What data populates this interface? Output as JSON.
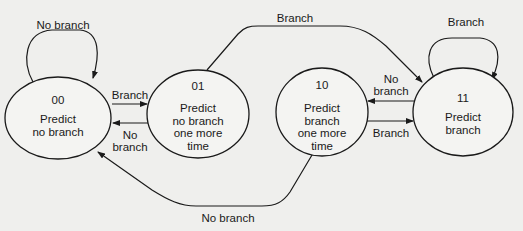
{
  "diagram": {
    "type": "state-machine",
    "colors": {
      "stroke": "#1a1a1a",
      "background": "#efefed"
    },
    "states": [
      {
        "id": "00",
        "text": [
          "Predict",
          "no branch"
        ]
      },
      {
        "id": "01",
        "text": [
          "Predict",
          "no branch",
          "one more",
          "time"
        ]
      },
      {
        "id": "10",
        "text": [
          "Predict",
          "branch",
          "one more",
          "time"
        ]
      },
      {
        "id": "11",
        "text": [
          "Predict",
          "branch"
        ]
      }
    ],
    "transitions": [
      {
        "from": "00",
        "to": "00",
        "label": "No branch"
      },
      {
        "from": "00",
        "to": "01",
        "label": "Branch"
      },
      {
        "from": "01",
        "to": "00",
        "label_lines": [
          "No",
          "branch"
        ]
      },
      {
        "from": "01",
        "to": "11",
        "label": "Branch"
      },
      {
        "from": "10",
        "to": "11",
        "label": "Branch"
      },
      {
        "from": "11",
        "to": "10",
        "label_lines": [
          "No",
          "branch"
        ]
      },
      {
        "from": "11",
        "to": "11",
        "label": "Branch"
      },
      {
        "from": "10",
        "to": "00",
        "label": "No branch"
      }
    ]
  }
}
